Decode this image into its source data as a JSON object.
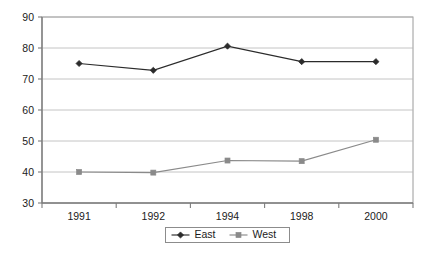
{
  "chart_data": {
    "type": "line",
    "title": "",
    "subtitle": "",
    "xlabel": "",
    "ylabel": "",
    "categories": [
      "1991",
      "1992",
      "1994",
      "1998",
      "2000"
    ],
    "series": [
      {
        "name": "East",
        "values": [
          75.0,
          72.8,
          80.6,
          75.6,
          75.6
        ],
        "color": "#2b2b2b",
        "marker": "diamond"
      },
      {
        "name": "West",
        "values": [
          40.0,
          39.8,
          43.7,
          43.5,
          50.4
        ],
        "color": "#8a8a8a",
        "marker": "square"
      }
    ],
    "ylim": [
      30,
      90
    ],
    "ytick_step": 10,
    "yticks": [
      "30",
      "40",
      "50",
      "60",
      "70",
      "80",
      "90"
    ],
    "grid": true,
    "grid_axis": "y",
    "legend_position": "bottom-center",
    "legend_entries": [
      "East",
      "West"
    ],
    "plot_background": "#ffffff",
    "grid_color": "#b5b5b5",
    "axis_color": "#7d7d7d"
  }
}
